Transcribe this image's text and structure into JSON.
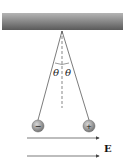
{
  "diagram": {
    "ceiling": {
      "x": 2,
      "y": 13,
      "width": 121,
      "height": 17
    },
    "pivot": {
      "x": 62,
      "y": 31
    },
    "angle_label": "θ",
    "balls": [
      {
        "name": "negative",
        "charge_symbol": "−",
        "cx": 38,
        "cy": 126,
        "r": 6
      },
      {
        "name": "positive",
        "charge_symbol": "+",
        "cx": 89,
        "cy": 126,
        "r": 6
      }
    ],
    "field_label": "E",
    "arrows": [
      {
        "x1": 27,
        "y1": 138,
        "x2": 100,
        "y2": 138
      },
      {
        "x1": 27,
        "y1": 156,
        "x2": 100,
        "y2": 156
      }
    ],
    "colors": {
      "ceiling_dark": "#555555",
      "ceiling_light": "#aaaaaa",
      "ball": "#8a8a8a",
      "line": "#333333"
    }
  }
}
